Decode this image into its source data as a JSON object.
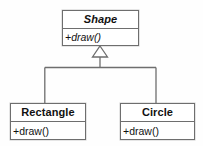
{
  "diagram": {
    "type": "uml-class-diagram",
    "relationship": "generalization",
    "background_color": "#fefefe",
    "line_color": "#6e6e6e",
    "text_color": "#111111",
    "classes": [
      {
        "id": "shape",
        "name": "Shape",
        "abstract": true,
        "members": [
          "+draw()"
        ]
      },
      {
        "id": "rectangle",
        "name": "Rectangle",
        "abstract": false,
        "members": [
          "+draw()"
        ]
      },
      {
        "id": "circle",
        "name": "Circle",
        "abstract": false,
        "members": [
          "+draw()"
        ]
      }
    ],
    "edges": [
      {
        "from": "rectangle",
        "to": "shape",
        "kind": "generalization",
        "arrowhead": "hollow-triangle"
      },
      {
        "from": "circle",
        "to": "shape",
        "kind": "generalization",
        "arrowhead": "hollow-triangle"
      }
    ]
  }
}
